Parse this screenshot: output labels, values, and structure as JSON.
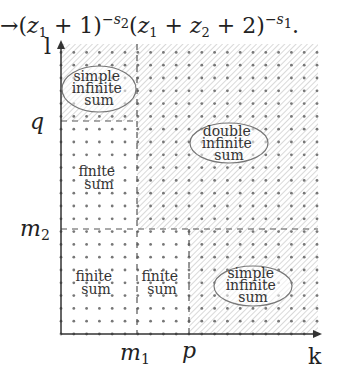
{
  "formula": {
    "arrow": "→",
    "part1_open": "(",
    "z1_var": "z",
    "z1_sub": "1",
    "part1_rest": " + 1)",
    "part1_exp": "−s",
    "part1_exp_sub": "2",
    "part2_open": "(",
    "part2_z1": "z",
    "part2_z1_sub": "1",
    "part2_plus": " + ",
    "part2_z2": "z",
    "part2_z2_sub": "2",
    "part2_rest": " + 2)",
    "part2_exp": "−s",
    "part2_exp_sub": "1",
    "end": "."
  },
  "axes": {
    "x_label": "k",
    "y_label": "l",
    "x_ticks": [
      {
        "label": "m",
        "sub": "1",
        "x": 137
      },
      {
        "label": "p",
        "sub": "",
        "x": 189
      }
    ],
    "y_ticks": [
      {
        "label": "q",
        "sub": "",
        "y": 121
      },
      {
        "label": "m",
        "sub": "2",
        "y": 229
      }
    ]
  },
  "regions": [
    {
      "name": "simple-infinite-sum-top",
      "lines": [
        "simple",
        "infinite",
        "sum"
      ],
      "hatched": true,
      "circled": true
    },
    {
      "name": "finite-sum-left",
      "lines": [
        "finite",
        "sum"
      ],
      "hatched": false,
      "circled": false
    },
    {
      "name": "double-infinite-sum",
      "lines": [
        "double",
        "infinite",
        "sum"
      ],
      "hatched": true,
      "circled": true
    },
    {
      "name": "finite-sum-bottom-left",
      "lines": [
        "finite",
        "sum"
      ],
      "hatched": false,
      "circled": false
    },
    {
      "name": "finite-sum-bottom-middle",
      "lines": [
        "finite",
        "sum"
      ],
      "hatched": false,
      "circled": false
    },
    {
      "name": "simple-infinite-sum-bottom-right",
      "lines": [
        "simple",
        "infinite",
        "sum"
      ],
      "hatched": true,
      "circled": true
    }
  ],
  "colors": {
    "axis": "#333333",
    "dots": "#777777",
    "hatch": "#cfcfcf",
    "text": "#333333"
  }
}
